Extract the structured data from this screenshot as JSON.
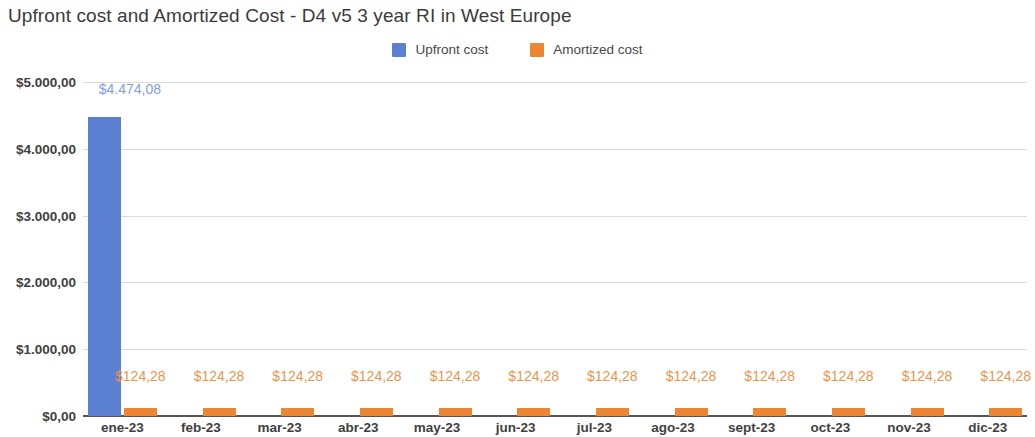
{
  "chart_data": {
    "type": "bar",
    "title": "Upfront cost and Amortized Cost - D4 v5 3 year RI in West Europe",
    "xlabel": "",
    "ylabel": "",
    "categories": [
      "ene-23",
      "feb-23",
      "mar-23",
      "abr-23",
      "may-23",
      "jun-23",
      "jul-23",
      "ago-23",
      "sept-23",
      "oct-23",
      "nov-23",
      "dic-23"
    ],
    "series": [
      {
        "name": "Upfront cost",
        "color": "#5b7fd1",
        "label_color": "#7fa0e0",
        "values": [
          4474.08,
          0,
          0,
          0,
          0,
          0,
          0,
          0,
          0,
          0,
          0,
          0
        ],
        "data_labels": [
          "$4.474,08",
          "",
          "",
          "",
          "",
          "",
          "",
          "",
          "",
          "",
          "",
          ""
        ]
      },
      {
        "name": "Amortized cost",
        "color": "#ed8633",
        "label_color": "#e8964b",
        "values": [
          124.28,
          124.28,
          124.28,
          124.28,
          124.28,
          124.28,
          124.28,
          124.28,
          124.28,
          124.28,
          124.28,
          124.28
        ],
        "data_labels": [
          "$124,28",
          "$124,28",
          "$124,28",
          "$124,28",
          "$124,28",
          "$124,28",
          "$124,28",
          "$124,28",
          "$124,28",
          "$124,28",
          "$124,28",
          "$124,28"
        ]
      }
    ],
    "ylim": [
      0,
      5000
    ],
    "ytick_values": [
      0,
      1000,
      2000,
      3000,
      4000,
      5000
    ],
    "ytick_labels": [
      "$0,00",
      "$1.000,00",
      "$2.000,00",
      "$3.000,00",
      "$4.000,00",
      "$5.000,00"
    ],
    "grid": true,
    "legend_position": "top-center",
    "background_color": "#ffffff",
    "gridline_color": "#dcdcdc",
    "axis_color": "#555555"
  },
  "legend": {
    "items": [
      {
        "label": "Upfront cost",
        "color": "#5b7fd1"
      },
      {
        "label": "Amortized cost",
        "color": "#ed8633"
      }
    ]
  }
}
